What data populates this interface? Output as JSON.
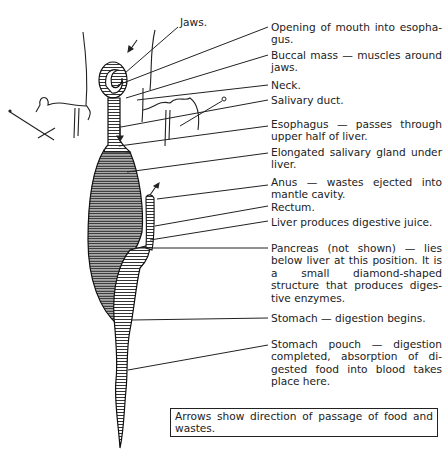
{
  "diagram": {
    "labels": {
      "jaws": "Jaws.",
      "opening": "Opening of mouth into esopha-gus.",
      "buccal": "Buccal mass — muscles around jaws.",
      "neck": "Neck.",
      "salivary_duct": "Salivary duct.",
      "esophagus": "Esophagus — passes through upper half of liver.",
      "salivary_gland": "Elongated salivary gland under liver.",
      "anus": "Anus — wastes ejected into mantle cavity.",
      "rectum": "Rectum.",
      "liver": "Liver produces digestive juice.",
      "pancreas": "Pancreas (not shown) — lies below liver at this position. It is a small diamond-shaped structure that produces diges-tive enzymes.",
      "stomach": "Stomach — digestion begins.",
      "stomach_pouch": "Stomach pouch — digestion completed, absorption of di-gested food into blood takes place here."
    },
    "note": "Arrows show direction of passage of food and wastes."
  }
}
